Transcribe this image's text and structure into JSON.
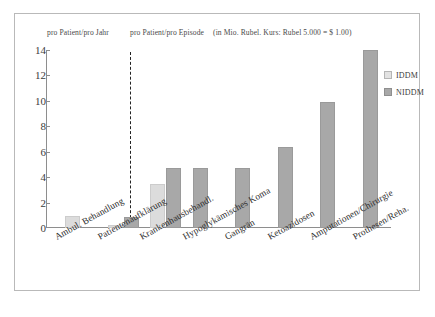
{
  "figure": {
    "captions": {
      "per_year": "pro Patient/pro Jahr",
      "per_episode": "pro Patient/pro Episode",
      "currency_note": "(in Mio. Rubel. Kurs: Rubel 5.000 = $ 1.00)"
    }
  },
  "legend": {
    "position": "top-right",
    "entries": [
      {
        "label": "IDDM",
        "color": "#e2e2e2"
      },
      {
        "label": "NIDDM",
        "color": "#a8a8a8"
      }
    ]
  },
  "chart_data": {
    "type": "bar",
    "title": "",
    "subtitle": "",
    "xlabel": "",
    "ylabel": "",
    "ylim": [
      0,
      14
    ],
    "yticks": [
      0,
      2,
      4,
      6,
      8,
      10,
      12,
      14
    ],
    "ytick_labels": [
      "0",
      "2",
      "4",
      "6",
      "8",
      "10",
      "12",
      "14"
    ],
    "grid": false,
    "annotation_divider_after_category": 2,
    "categories": [
      "Ambul. Behandlung",
      "Patientenaufklärung",
      "Krankenhausbehandl.",
      "Hypoglykämisches Koma",
      "Gangrän",
      "Ketoazidosen",
      "Amputationen/Chirurgie",
      "Prothesen/Reha."
    ],
    "series": [
      {
        "name": "IDDM",
        "color": "#dcdcdc",
        "values": [
          0.95,
          0.2,
          3.5,
          0,
          0,
          0,
          0,
          0
        ]
      },
      {
        "name": "NIDDM",
        "color": "#a8a8a8",
        "values": [
          0,
          0.9,
          4.7,
          4.7,
          4.7,
          6.4,
          9.9,
          14.0
        ]
      }
    ]
  }
}
